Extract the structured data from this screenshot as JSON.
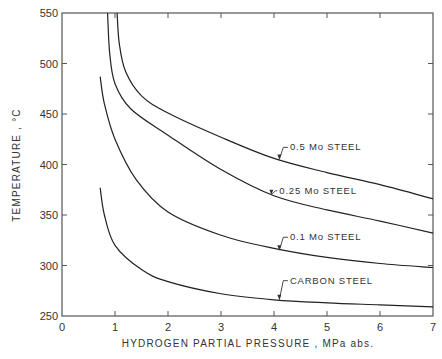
{
  "chart_data": {
    "type": "line",
    "title": "",
    "xlabel": "HYDROGEN  PARTIAL  PRESSURE , MPa  abs.",
    "ylabel": "TEMPERATURE ,  °C",
    "xlim": [
      0,
      7
    ],
    "ylim": [
      250,
      550
    ],
    "xticks": [
      0,
      1,
      2,
      3,
      4,
      5,
      6,
      7
    ],
    "yticks": [
      250,
      300,
      350,
      400,
      450,
      500,
      550
    ],
    "grid": false,
    "legend_position": "inline-labels",
    "series": [
      {
        "name": "0.5 Mo STEEL",
        "x": [
          1.04,
          1.08,
          1.2,
          1.5,
          2.0,
          3.0,
          4.0,
          5.0,
          6.0,
          7.0
        ],
        "y": [
          550,
          520,
          492,
          468,
          451,
          427,
          406,
          392,
          380,
          366
        ]
      },
      {
        "name": "0.25 Mo STEEL",
        "x": [
          0.86,
          0.9,
          1.0,
          1.3,
          2.0,
          3.0,
          4.0,
          5.0,
          6.0,
          7.0
        ],
        "y": [
          550,
          510,
          480,
          455,
          429,
          395,
          369,
          355,
          344,
          332
        ]
      },
      {
        "name": "0.1 Mo STEEL",
        "x": [
          0.72,
          0.8,
          1.0,
          1.4,
          2.0,
          3.0,
          4.0,
          5.0,
          6.0,
          7.0
        ],
        "y": [
          487,
          460,
          425,
          385,
          353,
          330,
          317,
          308,
          302,
          298
        ]
      },
      {
        "name": "CARBON STEEL",
        "x": [
          0.72,
          0.8,
          1.0,
          1.5,
          2.0,
          3.0,
          4.0,
          5.0,
          6.0,
          7.0
        ],
        "y": [
          377,
          350,
          320,
          296,
          284,
          272,
          266,
          263,
          261,
          259
        ]
      }
    ],
    "annotations": [
      {
        "text": "0.5  Mo  STEEL",
        "x": 4.3,
        "y": 414,
        "arrow_to": [
          4.1,
          405
        ]
      },
      {
        "text": "0.25  Mo  STEEL",
        "x": 4.1,
        "y": 371,
        "arrow_to": [
          3.95,
          370
        ]
      },
      {
        "text": "0.1  Mo  STEEL",
        "x": 4.3,
        "y": 325,
        "arrow_to": [
          4.1,
          315
        ]
      },
      {
        "text": "CARBON  STEEL",
        "x": 4.3,
        "y": 282,
        "arrow_to": [
          4.1,
          266
        ]
      }
    ]
  }
}
